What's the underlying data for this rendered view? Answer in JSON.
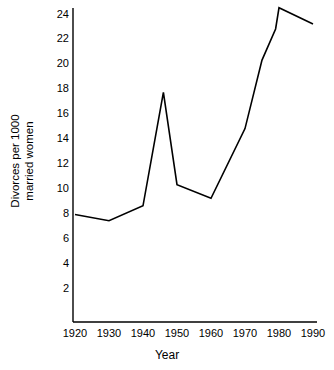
{
  "chart_data": {
    "type": "line",
    "title": "",
    "xlabel": "Year",
    "ylabel_line1": "Divorces per 1000",
    "ylabel_line2": "married women",
    "ylabel": "Divorces per 1000 married women",
    "x": [
      1920,
      1930,
      1940,
      1946,
      1950,
      1960,
      1970,
      1975,
      1979,
      1980,
      1990
    ],
    "values": [
      7.9,
      7.4,
      8.6,
      17.7,
      10.3,
      9.2,
      14.8,
      20.3,
      22.8,
      24.5,
      23.2
    ],
    "xlim": [
      1918,
      1992
    ],
    "ylim": [
      0,
      25.2
    ],
    "xticks": [
      1920,
      1930,
      1940,
      1950,
      1960,
      1970,
      1980,
      1990
    ],
    "xtick_labels": [
      "1920",
      "1930",
      "1940",
      "1950",
      "1960",
      "1970",
      "1980",
      "1990"
    ],
    "yticks": [
      2,
      4,
      6,
      8,
      10,
      12,
      14,
      16,
      18,
      20,
      22,
      24
    ],
    "ytick_labels": [
      "2",
      "4",
      "6",
      "8",
      "10",
      "12",
      "14",
      "16",
      "18",
      "20",
      "22",
      "24"
    ],
    "grid": false,
    "legend": false,
    "line_color": "#000000",
    "axis_color": "#000000",
    "background_color": "#ffffff",
    "series": [
      {
        "name": "Divorce rate",
        "points": [
          {
            "x": 1920,
            "y": 7.9
          },
          {
            "x": 1930,
            "y": 7.4
          },
          {
            "x": 1940,
            "y": 8.6
          },
          {
            "x": 1946,
            "y": 17.7
          },
          {
            "x": 1950,
            "y": 10.3
          },
          {
            "x": 1960,
            "y": 9.2
          },
          {
            "x": 1970,
            "y": 14.8
          },
          {
            "x": 1975,
            "y": 20.3
          },
          {
            "x": 1979,
            "y": 22.8
          },
          {
            "x": 1980,
            "y": 24.5
          },
          {
            "x": 1990,
            "y": 23.2
          }
        ]
      }
    ]
  }
}
